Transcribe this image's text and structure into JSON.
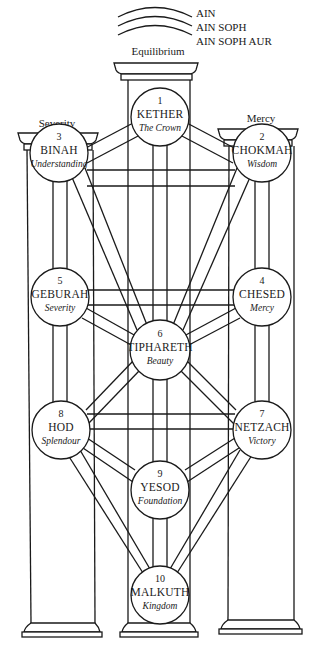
{
  "veils": [
    "AIN",
    "AIN SOPH",
    "AIN SOPH AUR"
  ],
  "pillars": {
    "left": "Severity",
    "center": "Equilibrium",
    "right": "Mercy"
  },
  "sephiroth": [
    {
      "num": "1",
      "name": "KETHER",
      "meaning": "The Crown",
      "cx": 160,
      "cy": 117
    },
    {
      "num": "2",
      "name": "CHOKMAH",
      "meaning": "Wisdom",
      "cx": 262,
      "cy": 150
    },
    {
      "num": "3",
      "name": "BINAH",
      "meaning": "Understanding",
      "cx": 60,
      "cy": 150
    },
    {
      "num": "4",
      "name": "CHESED",
      "meaning": "Mercy",
      "cx": 262,
      "cy": 297
    },
    {
      "num": "5",
      "name": "GEBURAH",
      "meaning": "Severity",
      "cx": 60,
      "cy": 297
    },
    {
      "num": "6",
      "name": "TIPHARETH",
      "meaning": "Beauty",
      "cx": 160,
      "cy": 350
    },
    {
      "num": "7",
      "name": "NETZACH",
      "meaning": "Victory",
      "cx": 262,
      "cy": 430
    },
    {
      "num": "8",
      "name": "HOD",
      "meaning": "Splendour",
      "cx": 60,
      "cy": 430
    },
    {
      "num": "9",
      "name": "YESOD",
      "meaning": "Foundation",
      "cx": 160,
      "cy": 490
    },
    {
      "num": "10",
      "name": "MALKUTH",
      "meaning": "Kingdom",
      "cx": 160,
      "cy": 595
    }
  ],
  "colors": {
    "ink": "#1a1a1a",
    "background": "#ffffff"
  }
}
